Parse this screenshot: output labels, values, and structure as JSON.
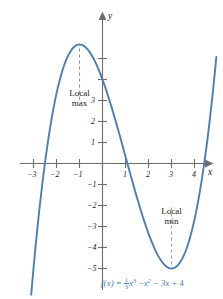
{
  "chart_data": {
    "type": "line",
    "title": "",
    "subtitle": "",
    "function_label": "f(x) = (1/3)x^3 - x^2 - 3x + 4",
    "equation_parts": {
      "lhs": "f(x)",
      "equals": "=",
      "frac_num": "1",
      "frac_den": "3",
      "term1_var": "x",
      "term1_exp": "3",
      "op1": "−",
      "term2_var": "x",
      "term2_exp": "2",
      "op2": "−",
      "term3": "3x",
      "op3": "+",
      "term4": "4"
    },
    "xlabel": "x",
    "ylabel": "y",
    "xlim": [
      -3.4,
      5.0
    ],
    "ylim": [
      -5.9,
      6.3
    ],
    "x_ticks": [
      -3,
      -2,
      -1,
      1,
      2,
      3,
      4
    ],
    "x_tick_labels": [
      "−3",
      "−2",
      "−1",
      "1",
      "2",
      "3",
      "4"
    ],
    "y_ticks": [
      -5,
      -4,
      -3,
      -2,
      -1,
      1,
      2,
      3,
      4,
      5
    ],
    "y_tick_labels": [
      "−5",
      "−4",
      "−3",
      "−2",
      "−1",
      "1",
      "2",
      "3",
      "",
      ""
    ],
    "grid": false,
    "legend": "none",
    "curve_color": "#4a7fb5",
    "axis_color": "#6d6d6d",
    "dash_color_max": "#9a9a9a",
    "dash_color_min": "#b0a08a",
    "equation_color": "#3f7cb5",
    "annotations": [
      {
        "name": "local-max",
        "line1": "Local",
        "line2": "max",
        "x": -1,
        "y": 5.666666666666667
      },
      {
        "name": "local-min",
        "line1": "Local",
        "line2": "min",
        "x": 3,
        "y": -5
      }
    ],
    "x": [
      -3.4,
      -3.2,
      -3.0,
      -2.8,
      -2.6,
      -2.4,
      -2.2,
      -2.0,
      -1.8,
      -1.6,
      -1.4,
      -1.2,
      -1.0,
      -0.8,
      -0.6,
      -0.4,
      -0.2,
      0.0,
      0.2,
      0.4,
      0.6,
      0.8,
      1.0,
      1.2,
      1.4,
      1.6,
      1.8,
      2.0,
      2.2,
      2.4,
      2.6,
      2.8,
      3.0,
      3.2,
      3.4,
      3.6,
      3.8,
      4.0,
      4.2,
      4.4,
      4.6,
      4.75
    ],
    "y": [
      -14.27,
      -12.25,
      -10.4,
      -8.69,
      -7.14,
      -5.73,
      -4.47,
      -3.33,
      -2.33,
      -1.45,
      -0.69,
      -0.04,
      0.5,
      0.95,
      1.3,
      1.58,
      1.77,
      1.9,
      1.96,
      1.97,
      1.93,
      1.84,
      1.7,
      1.52,
      1.3,
      1.05,
      0.76,
      0.44,
      0.09,
      -0.29,
      -0.7,
      -1.13,
      -1.6,
      -2.08,
      -2.59,
      -3.12,
      -3.68,
      -4.25,
      -4.85,
      -5.47,
      -6.12,
      0.0
    ]
  },
  "curve_path": {
    "description": "cubic f(x) = x^3/3 - x^2 - 3x + 4 plotted over the visible window"
  }
}
